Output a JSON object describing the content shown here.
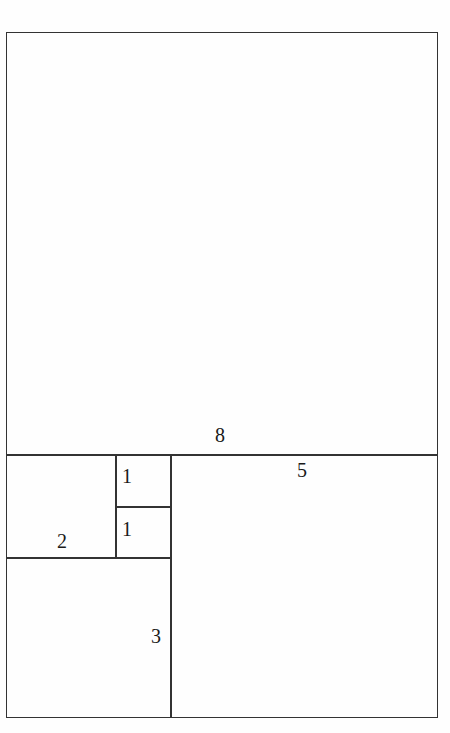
{
  "figure": {
    "background_color": "#fefefe",
    "line_color": "#333333",
    "label_color": "#1a1a1a"
  },
  "chart_data": {
    "type": "diagram",
    "title": "",
    "xlabel": "",
    "ylabel": "",
    "squares": [
      {
        "label": "8",
        "side": 8,
        "position": "top",
        "x": 6,
        "y": 32,
        "w": 432,
        "h": 423
      },
      {
        "label": "5",
        "side": 5,
        "position": "bottom-right",
        "x": 171,
        "y": 455,
        "w": 267,
        "h": 263
      },
      {
        "label": "3",
        "side": 3,
        "position": "bottom-left",
        "x": 6,
        "y": 558,
        "w": 165,
        "h": 160
      },
      {
        "label": "2",
        "side": 2,
        "position": "middle-left",
        "x": 6,
        "y": 455,
        "w": 110,
        "h": 103
      },
      {
        "label": "1",
        "side": 1,
        "position": "middle-upper",
        "x": 116,
        "y": 455,
        "w": 55,
        "h": 52
      },
      {
        "label": "1",
        "side": 1,
        "position": "middle-lower",
        "x": 116,
        "y": 507,
        "w": 55,
        "h": 51
      }
    ]
  },
  "labels": {
    "eight": "8",
    "five": "5",
    "three": "3",
    "two": "2",
    "one_upper": "1",
    "one_lower": "1"
  }
}
